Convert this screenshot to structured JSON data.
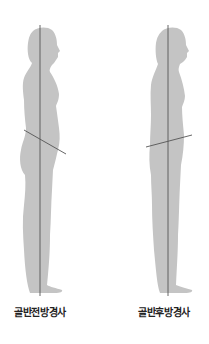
{
  "figures": [
    {
      "label": "골반전방경사",
      "label_center_x": 40,
      "plumb_line": {
        "x": 40,
        "y1": 25,
        "y2": 296
      },
      "pelvis_line": {
        "x1": 24,
        "y1": 130,
        "x2": 66,
        "y2": 154
      }
    },
    {
      "label": "골반후방경사",
      "label_center_x": 164,
      "plumb_line": {
        "x": 168,
        "y1": 25,
        "y2": 296
      },
      "pelvis_line": {
        "x1": 146,
        "y1": 147,
        "x2": 192,
        "y2": 135
      }
    }
  ],
  "colors": {
    "silhouette": "#c4c4c4",
    "line": "#555555",
    "label": "#222222",
    "background": "#ffffff"
  }
}
